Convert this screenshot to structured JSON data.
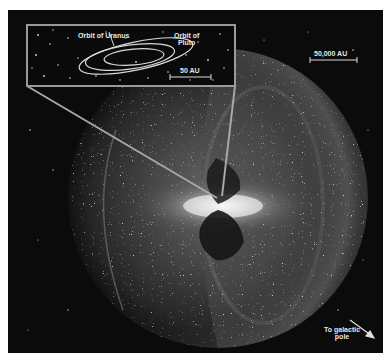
{
  "figure": {
    "colors": {
      "background": "#0b0b0b",
      "inset_border": "#9a9a9a",
      "orbit_lines": "#d9d9d9",
      "label_text": "#e6e6e6"
    }
  },
  "inset": {
    "labels": {
      "orbit_uranus": "Orbit of Uranus",
      "orbit_pluto_line1": "Orbit of",
      "orbit_pluto_line2": "Pluto"
    },
    "scale_bar": {
      "label": "50 AU"
    }
  },
  "main": {
    "scale_bar": {
      "label": "50,000 AU"
    },
    "galactic_pole": {
      "line1": "To galactic",
      "line2": "pole",
      "icon": "arrow-down-right-icon"
    }
  }
}
